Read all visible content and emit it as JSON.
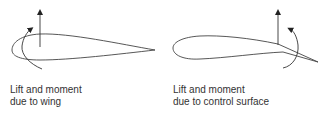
{
  "figure": {
    "panels": [
      {
        "id": "wing",
        "caption_line1": "Lift and moment",
        "caption_line2": "due to wing"
      },
      {
        "id": "control_surface",
        "caption_line1": "Lift and moment",
        "caption_line2": "due to control surface"
      }
    ],
    "colors": {
      "stroke": "#444444",
      "text": "#333333",
      "background": "#ffffff"
    }
  }
}
